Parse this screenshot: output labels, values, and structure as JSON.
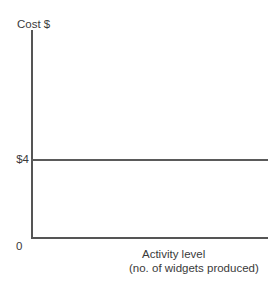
{
  "chart_data": {
    "type": "line",
    "title": "",
    "subtitle": "",
    "ylabel": "Cost $",
    "xlabel_line1": "Activity level",
    "xlabel_line2": "(no. of widgets produced)",
    "origin_label": "0",
    "y_tick_labels": [
      "$4"
    ],
    "y_tick_values": [
      4
    ],
    "x_tick_labels": [],
    "grid": false,
    "legend": null,
    "xlim": [
      0,
      100
    ],
    "ylim": [
      0,
      10.6
    ],
    "series": [
      {
        "name": "Unit variable cost",
        "x": [
          0,
          100
        ],
        "values": [
          4,
          4
        ],
        "color": "#5a5a5a"
      }
    ],
    "annotations": [],
    "colors": {
      "axis": "#555555",
      "series": "#5a5a5a",
      "text": "#3a3a3a",
      "background": "#ffffff"
    }
  }
}
